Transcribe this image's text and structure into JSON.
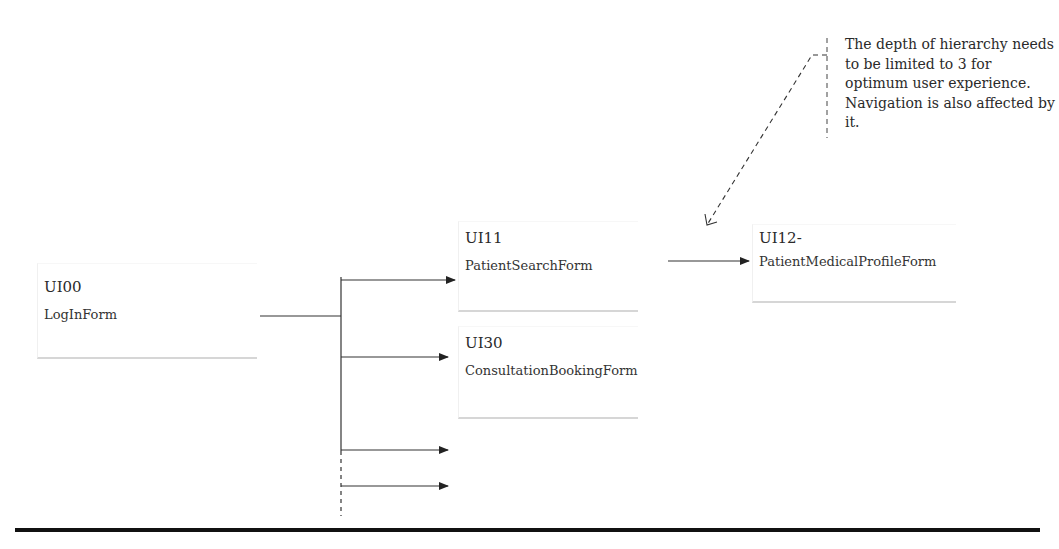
{
  "nodes": [
    {
      "id": "UI00",
      "code": "UI00",
      "name": "LogInForm"
    },
    {
      "id": "UI11",
      "code": "UI11",
      "name": "PatientSearchForm"
    },
    {
      "id": "UI30",
      "code": "UI30",
      "name": "ConsultationBookingForm"
    },
    {
      "id": "UI12",
      "code": "UI12-",
      "name": "PatientMedicalProfileForm"
    }
  ],
  "edges": [
    {
      "from": "UI00",
      "to": "UI11"
    },
    {
      "from": "UI00",
      "to": "UI30"
    },
    {
      "from": "UI00",
      "to": "(unlabeled)"
    },
    {
      "from": "UI00",
      "to": "(unlabeled, dashed branch)"
    },
    {
      "from": "UI11",
      "to": "UI12"
    }
  ],
  "annotation": {
    "text": "The depth of hierarchy needs to be limited to 3 for optimum user experience. Navigation is also affected by it.",
    "points_to": "UI11 -> UI12 arrow"
  },
  "colors": {
    "line": "#333333",
    "box_underline": "#d6d6d6",
    "rule": "#111111"
  }
}
